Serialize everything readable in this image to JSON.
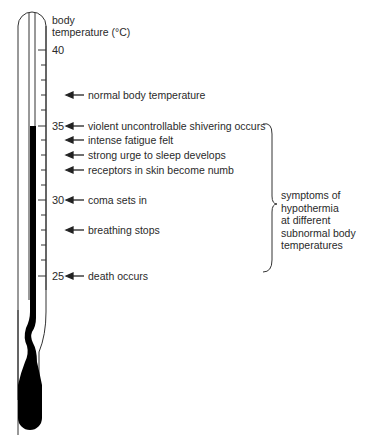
{
  "axis": {
    "title_line1": "body",
    "title_line2": "temperature (°C)",
    "ticks": [
      {
        "value": "40",
        "y": 50
      },
      {
        "value": "35",
        "y": 126
      },
      {
        "value": "30",
        "y": 200
      },
      {
        "value": "25",
        "y": 276
      }
    ]
  },
  "annotations": [
    {
      "text": "normal body temperature",
      "y": 95
    },
    {
      "text": "violent uncontrollable shivering occurs",
      "y": 126
    },
    {
      "text": "intense fatigue felt",
      "y": 140
    },
    {
      "text": "strong urge to sleep develops",
      "y": 155
    },
    {
      "text": "receptors in skin become numb",
      "y": 170
    },
    {
      "text": "coma sets in",
      "y": 200
    },
    {
      "text": "breathing stops",
      "y": 230
    },
    {
      "text": "death occurs",
      "y": 276
    }
  ],
  "bracket_label": {
    "line1": "symptoms of",
    "line2": "hypothermia",
    "line3": "at different",
    "line4": "subnormal body",
    "line5": "temperatures"
  },
  "colors": {
    "line": "#333333",
    "mercury": "#000000",
    "text": "#2a2a2a"
  }
}
